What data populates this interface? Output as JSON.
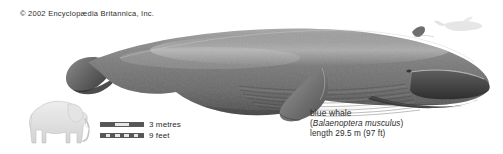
{
  "figure": {
    "copyright": "© 2002 Encyclopædia Britannica, Inc.",
    "background_color": "#ffffff"
  },
  "subject": {
    "illustration_name": "blue-whale-lateral-view",
    "orientation": "facing-right",
    "body_color": "#808080",
    "body_dark_color": "#4a4a4a",
    "body_light_color": "#c9c9c9"
  },
  "caption": {
    "common_name": "blue whale",
    "scientific_name_open": "(",
    "scientific_name": "Balaenoptera musculus",
    "scientific_name_close": ")",
    "length": "length 29.5 m (97 ft)"
  },
  "scale": {
    "comparison_silhouette": "elephant-silhouette",
    "bars": [
      {
        "label": "3 metres",
        "style": "solid-segmented",
        "segments": 3
      },
      {
        "label": "9 feet",
        "style": "checkered",
        "segments": 9
      }
    ],
    "bar_dark_color": "#565656",
    "bar_light_color": "#e6e6e6"
  },
  "inset": {
    "name": "small-whale-silhouette",
    "color": "#d7d7d7"
  }
}
